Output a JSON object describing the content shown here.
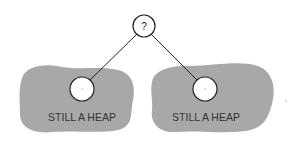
{
  "diagram": {
    "root": {
      "label": "?",
      "cx": 144,
      "cy": 26,
      "r": 11
    },
    "left_subtree": {
      "label": "STILL A HEAP",
      "node": {
        "cx": 82,
        "cy": 89,
        "r": 12
      }
    },
    "right_subtree": {
      "label": "STILL A HEAP",
      "node": {
        "cx": 205,
        "cy": 89,
        "r": 12
      }
    },
    "colors": {
      "blob": "#a8a8a8",
      "node_fill": "#ffffff",
      "stroke": "#222222",
      "background": "#ffffff"
    }
  }
}
